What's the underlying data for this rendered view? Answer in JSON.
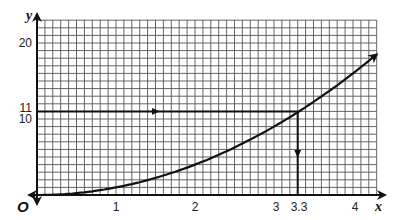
{
  "chart_data": {
    "type": "line",
    "title": "",
    "xlabel": "x",
    "ylabel": "y",
    "origin_label": "O",
    "xlim": [
      0,
      4.3
    ],
    "ylim": [
      0,
      23
    ],
    "grid": true,
    "x_ticks": [
      {
        "value": 1,
        "label": "1"
      },
      {
        "value": 2,
        "label": "2"
      },
      {
        "value": 3,
        "label": "3"
      },
      {
        "value": 3.3,
        "label": "3.3"
      },
      {
        "value": 4,
        "label": "4"
      }
    ],
    "y_ticks": [
      {
        "value": 10,
        "label": "10"
      },
      {
        "value": 11,
        "label": "11"
      },
      {
        "value": 20,
        "label": "20"
      }
    ],
    "series": [
      {
        "name": "curve",
        "function": "y = x^2",
        "x": [
          0,
          0.5,
          1,
          1.5,
          2,
          2.5,
          3,
          3.3,
          3.5,
          4,
          4.3
        ],
        "y": [
          0,
          0.25,
          1,
          2.25,
          4,
          6.25,
          9,
          10.89,
          12.25,
          16,
          18.5
        ]
      }
    ],
    "annotations": [
      {
        "type": "arrow-line",
        "from": [
          0,
          11
        ],
        "to": [
          3.3,
          11
        ],
        "label": "read across at y = 11"
      },
      {
        "type": "arrow-line",
        "from": [
          3.3,
          11
        ],
        "to": [
          3.3,
          0
        ],
        "label": "read down to x = 3.3"
      }
    ],
    "legend": null
  },
  "labels": {
    "x_axis": "x",
    "y_axis": "y",
    "origin": "O",
    "x1": "1",
    "x2": "2",
    "x3": "3",
    "x33": "3.3",
    "x4": "4",
    "y10": "10",
    "y11": "11",
    "y20": "20"
  }
}
